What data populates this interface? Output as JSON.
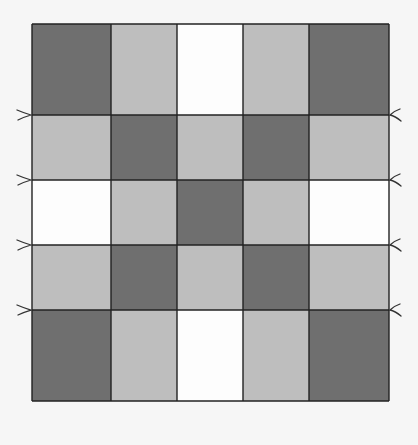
{
  "diagram": {
    "title": "",
    "type": "quilt-grid",
    "rows": 5,
    "cols": 5,
    "col_edges": [
      32,
      111,
      177,
      243,
      309,
      389
    ],
    "row_edges": [
      24,
      115,
      180,
      245,
      310,
      401
    ],
    "colors": {
      "D": "#6f6f6f",
      "L": "#bebebe",
      "W": "#fdfdfd",
      "line": "#222222",
      "background": "#f6f6f6"
    },
    "pattern": [
      [
        "D",
        "L",
        "W",
        "L",
        "D"
      ],
      [
        "L",
        "D",
        "L",
        "D",
        "L"
      ],
      [
        "W",
        "L",
        "D",
        "L",
        "W"
      ],
      [
        "L",
        "D",
        "L",
        "D",
        "L"
      ],
      [
        "D",
        "L",
        "W",
        "L",
        "D"
      ]
    ],
    "left_markers": [
      115,
      180,
      245,
      310
    ],
    "right_markers": [
      115,
      180,
      245,
      310
    ]
  }
}
